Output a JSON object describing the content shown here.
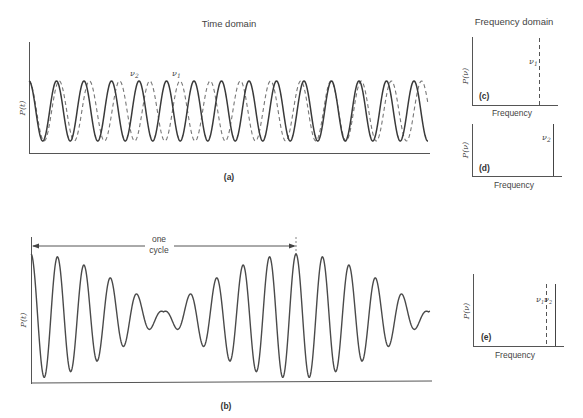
{
  "titles": {
    "time_domain": "Time domain",
    "frequency_domain": "Frequency domain"
  },
  "panels": {
    "a": {
      "label": "(a)",
      "ylabel": "P(t)",
      "nu2_label": "ν",
      "nu2_sub": "2",
      "nu1_label": "ν",
      "nu1_sub": "1"
    },
    "b": {
      "label": "(b)",
      "ylabel": "P(t)",
      "annotation_line1": "one",
      "annotation_line2": "cycle"
    },
    "c": {
      "label": "(c)",
      "ylabel": "P(ν)",
      "xlabel": "Frequency",
      "line_label": "ν",
      "line_sub": "1",
      "line_style": "dashed"
    },
    "d": {
      "label": "(d)",
      "ylabel": "P(ν)",
      "xlabel": "Frequency",
      "line_label": "ν",
      "line_sub": "2",
      "line_style": "solid"
    },
    "e": {
      "label": "(e)",
      "ylabel": "P(ν)",
      "xlabel": "Frequency",
      "line_label": "ν",
      "line_sub1": "1",
      "line_sub2": "2"
    }
  },
  "chart_data": [
    {
      "id": "a",
      "type": "line",
      "title": "Time domain",
      "ylabel": "P(t)",
      "xlabel": "",
      "description": "Two cosine waves of slightly different frequency overlaid",
      "series": [
        {
          "name": "ν2",
          "style": "solid",
          "period_px": 27.5,
          "amplitude": 1
        },
        {
          "name": "ν1",
          "style": "dashed",
          "period_px": 30.2,
          "amplitude": 1
        }
      ]
    },
    {
      "id": "b",
      "type": "line",
      "ylabel": "P(t)",
      "description": "Sum of ν1 and ν2 showing beats; one beat cycle marked",
      "annotation": "one cycle",
      "cycle_oscillations": 10
    },
    {
      "id": "c",
      "type": "bar",
      "xlabel": "Frequency",
      "ylabel": "P(ν)",
      "lines": [
        {
          "name": "ν1",
          "style": "dashed",
          "position": 0.79
        }
      ]
    },
    {
      "id": "d",
      "type": "bar",
      "xlabel": "Frequency",
      "ylabel": "P(ν)",
      "lines": [
        {
          "name": "ν2",
          "style": "solid",
          "position": 0.9
        }
      ]
    },
    {
      "id": "e",
      "type": "bar",
      "xlabel": "Frequency",
      "ylabel": "P(ν)",
      "lines": [
        {
          "name": "ν1",
          "style": "dashed",
          "position": 0.8
        },
        {
          "name": "ν2",
          "style": "solid",
          "position": 0.9
        }
      ]
    }
  ]
}
